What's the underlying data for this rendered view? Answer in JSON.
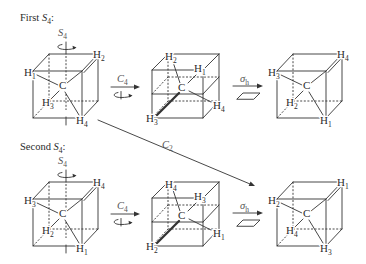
{
  "figure": {
    "atom_h": "H",
    "atom_c": "C",
    "rows": [
      {
        "heading": {
          "prefix": "First ",
          "op": "S",
          "op_sub": "4",
          "suffix": ":"
        },
        "axis": {
          "op": "S",
          "sub": "4"
        },
        "cubes": [
          {
            "front_top_left": "1",
            "back_top_right": "2",
            "back_bottom_left": "3",
            "front_bottom_right": "4"
          },
          {
            "back_top_left": "2",
            "top_right": "1",
            "right": "4",
            "front_bottom_left": "3"
          },
          {
            "front_top_left": "3",
            "back_top_right": "4",
            "back_bottom_left": "2",
            "front_bottom_right": "1"
          }
        ],
        "step1": {
          "op": "C",
          "sub": "4"
        },
        "step2": {
          "op": "σ",
          "sub": "h"
        }
      },
      {
        "heading": {
          "prefix": "Second ",
          "op": "S",
          "op_sub": "4",
          "suffix": ":"
        },
        "axis": {
          "op": "S",
          "sub": "4"
        },
        "cubes": [
          {
            "front_top_left": "3",
            "back_top_right": "4",
            "back_bottom_left": "2",
            "front_bottom_right": "1"
          },
          {
            "back_top_left": "4",
            "top_right": "3",
            "right": "1",
            "front_bottom_left": "2"
          },
          {
            "front_top_left": "2",
            "back_top_right": "1",
            "back_bottom_left": "4",
            "front_bottom_right": "3"
          }
        ],
        "step1": {
          "op": "C",
          "sub": "4"
        },
        "step2": {
          "op": "σ",
          "sub": "h"
        }
      }
    ],
    "cross_arrow": {
      "op": "C",
      "sub": "2"
    },
    "colors": {
      "line": "#333333",
      "text": "#2b2b2b",
      "background": "#ffffff"
    }
  }
}
